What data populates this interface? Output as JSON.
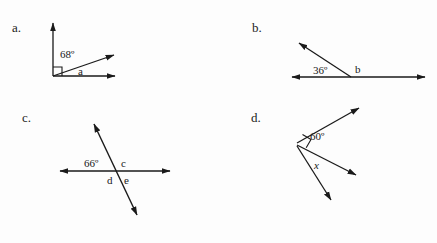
{
  "page": {
    "background_color": "#fdfdfd",
    "stroke_color": "#1a1a1a",
    "width": 437,
    "height": 243
  },
  "parts": {
    "a": {
      "label": "a.",
      "angle_label": "68º",
      "unknown_label": "a",
      "description": "Right angle formed by a vertical ray and a horizontal ray, divided by a diagonal ray",
      "right_angle_mark": true,
      "vertex": {
        "x": 53,
        "y": 76
      },
      "rays": [
        {
          "name": "vertical-ray",
          "to": {
            "x": 53,
            "y": 21
          },
          "arrow": true
        },
        {
          "name": "diagonal-ray",
          "to": {
            "x": 116,
            "y": 54
          },
          "arrow": true
        },
        {
          "name": "horizontal-ray",
          "to": {
            "x": 117,
            "y": 76
          },
          "arrow": true
        }
      ]
    },
    "b": {
      "label": "b.",
      "angle_label": "36º",
      "unknown_label": "b",
      "description": "Straight line with a ray rising to the upper left from a point on the line",
      "right_angle_mark": false,
      "vertex": {
        "x": 351,
        "y": 77
      },
      "line": {
        "from": {
          "x": 290,
          "y": 77
        },
        "to": {
          "x": 427,
          "y": 77
        },
        "arrow_both": true
      },
      "rays": [
        {
          "name": "upper-left-ray",
          "to": {
            "x": 297,
            "y": 41
          },
          "arrow": true
        }
      ]
    },
    "c": {
      "label": "c.",
      "angle_label": "66º",
      "unknown_labels": [
        "c",
        "d",
        "e"
      ],
      "description": "Two intersecting straight lines forming vertically opposite angles",
      "right_angle_mark": false,
      "intersection": {
        "x": 117,
        "y": 171
      },
      "lines": [
        {
          "name": "horizontal-line",
          "from": {
            "x": 58,
            "y": 171
          },
          "to": {
            "x": 172,
            "y": 171
          },
          "arrow_both": true
        },
        {
          "name": "diagonal-line",
          "from": {
            "x": 93,
            "y": 121
          },
          "to": {
            "x": 138,
            "y": 218
          },
          "arrow_both": true
        }
      ]
    },
    "d": {
      "label": "d.",
      "angle_label": "60º",
      "unknown_label": "x",
      "description": "Three rays from a common vertex forming two adjacent angles",
      "right_angle_mark": true,
      "vertex": {
        "x": 297,
        "y": 143
      },
      "rays": [
        {
          "name": "upper-ray",
          "to": {
            "x": 361,
            "y": 106
          },
          "arrow": true
        },
        {
          "name": "middle-ray",
          "to": {
            "x": 358,
            "y": 177
          },
          "arrow": true
        },
        {
          "name": "lower-ray",
          "to": {
            "x": 333,
            "y": 202
          },
          "arrow": true
        }
      ]
    }
  }
}
